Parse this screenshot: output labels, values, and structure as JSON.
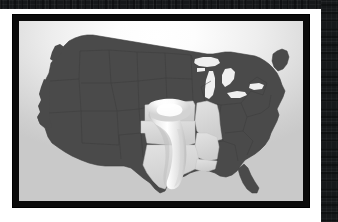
{
  "artwork": {
    "subject": "Tornado Alley map of the contiguous United States",
    "kind": "framed-illustration",
    "frame_color": "#0b0b0b",
    "matte_color": "#ffffff",
    "band_color": "#16181a"
  },
  "map": {
    "title": "",
    "background": {
      "type": "radial-gradient",
      "center_color": "#ffffff",
      "edge_color": "#c9c9c9"
    },
    "state_fill": "#4a4a4a",
    "state_border": "#3a3a3a",
    "highlight_fill": "#d8d8d8",
    "funnel_fill": "#f2f2f2",
    "funnel_glow": "#ffffff",
    "regions": [
      {
        "name": "non-alley-states",
        "label": "Contiguous United States",
        "fill": "#4a4a4a",
        "highlighted": false
      },
      {
        "name": "nebraska-kansas",
        "label": "Nebraska / Kansas",
        "fill": "#d8d8d8",
        "highlighted": true
      },
      {
        "name": "missouri",
        "label": "Missouri",
        "fill": "#d8d8d8",
        "highlighted": true
      },
      {
        "name": "oklahoma",
        "label": "Oklahoma",
        "fill": "#d8d8d8",
        "highlighted": true
      },
      {
        "name": "arkansas",
        "label": "Arkansas",
        "fill": "#d8d8d8",
        "highlighted": true
      },
      {
        "name": "texas",
        "label": "Texas",
        "fill": "#d8d8d8",
        "highlighted": true
      },
      {
        "name": "louisiana-edge",
        "label": "Louisiana",
        "fill": "#d8d8d8",
        "highlighted": true
      }
    ],
    "overlay": {
      "name": "tornado-funnel",
      "label": "Tornado funnel",
      "description": "Glossy white funnel cloud sweeping from the southern plains up toward Kansas"
    }
  }
}
